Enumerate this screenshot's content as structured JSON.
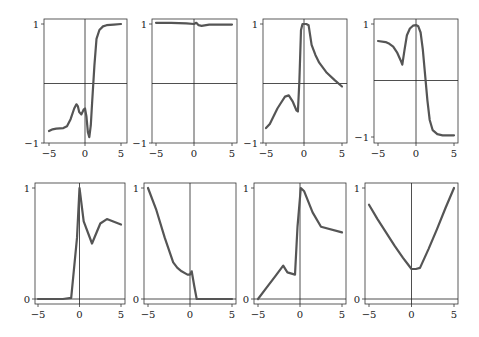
{
  "chart_data": [
    {
      "type": "line",
      "title": "",
      "xlabel": "",
      "ylabel": "",
      "xlim": [
        -5.5,
        5.5
      ],
      "ylim": [
        -1,
        1.05
      ],
      "xticks": [
        -5,
        0,
        5
      ],
      "yticks": [
        -1,
        1
      ],
      "x": [
        -5,
        -4.5,
        -4,
        -3,
        -2.5,
        -2,
        -1.5,
        -1.2,
        -1,
        -0.8,
        -0.5,
        -0.2,
        0,
        0.2,
        0.4,
        0.6,
        0.8,
        1.0,
        1.3,
        1.6,
        2.0,
        2.5,
        3,
        4,
        5
      ],
      "values": [
        -0.8,
        -0.77,
        -0.76,
        -0.75,
        -0.72,
        -0.6,
        -0.42,
        -0.35,
        -0.38,
        -0.48,
        -0.52,
        -0.44,
        -0.42,
        -0.55,
        -0.82,
        -0.9,
        -0.7,
        -0.3,
        0.3,
        0.75,
        0.9,
        0.96,
        0.98,
        0.99,
        1.0
      ]
    },
    {
      "type": "line",
      "title": "",
      "xlabel": "",
      "ylabel": "",
      "xlim": [
        -5.5,
        5.5
      ],
      "ylim": [
        -1,
        1.05
      ],
      "xticks": [
        -5,
        0,
        5
      ],
      "yticks": [
        -1,
        1
      ],
      "x": [
        -5,
        -3,
        -1,
        0,
        0.3,
        0.6,
        1,
        2,
        3,
        5
      ],
      "values": [
        1.02,
        1.02,
        1.01,
        1.0,
        1.02,
        0.98,
        0.97,
        0.99,
        0.99,
        0.99
      ]
    },
    {
      "type": "line",
      "title": "",
      "xlabel": "",
      "ylabel": "",
      "xlim": [
        -5.5,
        5.5
      ],
      "ylim": [
        -1,
        1.05
      ],
      "xticks": [
        -5,
        0,
        5
      ],
      "yticks": [
        -1,
        1
      ],
      "x": [
        -5,
        -4.5,
        -4,
        -3.5,
        -3,
        -2.5,
        -2,
        -1.5,
        -1,
        -0.8,
        -0.6,
        -0.4,
        -0.2,
        0,
        0.3,
        0.6,
        1,
        1.5,
        2,
        3,
        4,
        5
      ],
      "values": [
        -0.75,
        -0.68,
        -0.55,
        -0.42,
        -0.32,
        -0.22,
        -0.2,
        -0.3,
        -0.45,
        -0.47,
        0.05,
        0.9,
        1.0,
        1.0,
        1.0,
        0.98,
        0.65,
        0.48,
        0.35,
        0.18,
        0.06,
        -0.05
      ]
    },
    {
      "type": "line",
      "title": "",
      "xlabel": "",
      "ylabel": "",
      "xlim": [
        -5.5,
        5.5
      ],
      "ylim": [
        -1,
        1.05
      ],
      "xticks": [
        -5,
        0,
        5
      ],
      "yticks": [
        -1,
        1
      ],
      "x": [
        -5,
        -4,
        -3.5,
        -3,
        -2.5,
        -2,
        -1.8,
        -1.5,
        -1.2,
        -0.8,
        -0.4,
        0,
        0.3,
        0.6,
        0.9,
        1.2,
        1.5,
        1.8,
        2.2,
        2.8,
        3.5,
        4.5,
        5
      ],
      "values": [
        0.7,
        0.68,
        0.65,
        0.6,
        0.5,
        0.35,
        0.28,
        0.55,
        0.8,
        0.92,
        0.97,
        0.98,
        0.96,
        0.85,
        0.55,
        0.1,
        -0.35,
        -0.7,
        -0.88,
        -0.95,
        -0.97,
        -0.97,
        -0.97
      ]
    },
    {
      "type": "line",
      "title": "",
      "xlabel": "",
      "ylabel": "",
      "xlim": [
        -5.5,
        5.5
      ],
      "ylim": [
        -0.05,
        1.05
      ],
      "xticks": [
        -5,
        0,
        5
      ],
      "yticks": [
        0,
        1
      ],
      "x": [
        -5,
        -4,
        -3,
        -2,
        -1,
        -0.3,
        0,
        0.5,
        1.5,
        2.5,
        3.3,
        5
      ],
      "values": [
        0,
        0,
        0,
        0,
        0.01,
        0.55,
        1.0,
        0.7,
        0.5,
        0.68,
        0.72,
        0.67
      ]
    },
    {
      "type": "line",
      "title": "",
      "xlabel": "",
      "ylabel": "",
      "xlim": [
        -5.5,
        5.5
      ],
      "ylim": [
        -0.05,
        1.05
      ],
      "xticks": [
        -5,
        0,
        5
      ],
      "yticks": [
        0,
        1
      ],
      "x": [
        -5,
        -4,
        -3,
        -2,
        -1.5,
        -1,
        -0.3,
        0,
        0.2,
        0.5,
        0.8,
        2,
        3,
        4,
        5
      ],
      "values": [
        1.0,
        0.8,
        0.55,
        0.33,
        0.28,
        0.25,
        0.22,
        0.22,
        0.25,
        0.12,
        0.0,
        0.0,
        0.0,
        0.0,
        0.0
      ]
    },
    {
      "type": "line",
      "title": "",
      "xlabel": "",
      "ylabel": "",
      "xlim": [
        -5.5,
        5.5
      ],
      "ylim": [
        -0.05,
        1.05
      ],
      "xticks": [
        -5,
        0,
        5
      ],
      "yticks": [
        0,
        1
      ],
      "x": [
        -5,
        -4,
        -3,
        -2,
        -1.5,
        -0.6,
        -0.3,
        0.1,
        0.5,
        1.5,
        2.5,
        5
      ],
      "values": [
        0,
        0.1,
        0.2,
        0.3,
        0.24,
        0.22,
        0.65,
        1.0,
        0.97,
        0.78,
        0.65,
        0.6
      ]
    },
    {
      "type": "line",
      "title": "",
      "xlabel": "",
      "ylabel": "",
      "xlim": [
        -5.5,
        5.5
      ],
      "ylim": [
        -0.05,
        1.05
      ],
      "xticks": [
        -5,
        0,
        5
      ],
      "yticks": [
        0,
        1
      ],
      "x": [
        -5,
        -4,
        -3,
        -2,
        -1,
        -0.5,
        0,
        0.5,
        1,
        2,
        3,
        4,
        5
      ],
      "values": [
        0.85,
        0.72,
        0.6,
        0.48,
        0.37,
        0.32,
        0.27,
        0.27,
        0.28,
        0.45,
        0.63,
        0.82,
        1.0
      ]
    }
  ],
  "layout": {
    "panels": [
      {
        "left": 44,
        "right": 127,
        "top": 19,
        "bottom": 143,
        "y_at_top_tick": 24,
        "y_at_bottom_tick": 143,
        "x_at_neg5": 49,
        "x_at_pos5": 121
      },
      {
        "left": 152,
        "right": 237,
        "top": 19,
        "bottom": 143,
        "y_at_top_tick": 24,
        "y_at_bottom_tick": 143,
        "x_at_neg5": 156,
        "x_at_pos5": 232
      },
      {
        "left": 263,
        "right": 347,
        "top": 19,
        "bottom": 143,
        "y_at_top_tick": 24,
        "y_at_bottom_tick": 143,
        "x_at_neg5": 266,
        "x_at_pos5": 342
      },
      {
        "left": 374,
        "right": 458,
        "top": 19,
        "bottom": 143,
        "y_at_top_tick": 24,
        "y_at_bottom_tick": 137,
        "x_at_neg5": 378,
        "x_at_pos5": 454
      },
      {
        "left": 35,
        "right": 125,
        "top": 183,
        "bottom": 304,
        "y_at_top_tick": 188,
        "y_at_bottom_tick": 299,
        "x_at_neg5": 38,
        "x_at_pos5": 121
      },
      {
        "left": 144,
        "right": 236,
        "top": 183,
        "bottom": 304,
        "y_at_top_tick": 188,
        "y_at_bottom_tick": 299,
        "x_at_neg5": 148,
        "x_at_pos5": 232
      },
      {
        "left": 254,
        "right": 346,
        "top": 183,
        "bottom": 304,
        "y_at_top_tick": 188,
        "y_at_bottom_tick": 299,
        "x_at_neg5": 258,
        "x_at_pos5": 342
      },
      {
        "left": 365,
        "right": 458,
        "top": 183,
        "bottom": 304,
        "y_at_top_tick": 188,
        "y_at_bottom_tick": 299,
        "x_at_neg5": 369,
        "x_at_pos5": 454
      }
    ],
    "curve_color": "#555555",
    "axis_color": "#222222"
  }
}
